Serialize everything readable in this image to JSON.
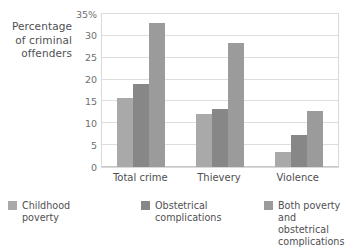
{
  "chart_data": {
    "type": "bar",
    "title": "",
    "subtitle": "",
    "xlabel": "",
    "ylabel": "Percentage of criminal offenders",
    "ylabel_lines": [
      "Percentage",
      "of criminal",
      "offenders"
    ],
    "categories": [
      "Total crime",
      "Thievery",
      "Violence"
    ],
    "series": [
      {
        "name": "Childhood poverty",
        "name_lines": [
          "Childhood",
          "poverty"
        ],
        "color": "#a9a9a9",
        "values": [
          15.7,
          12.1,
          3.5
        ]
      },
      {
        "name": "Obstetrical complications",
        "name_lines": [
          "Obstetrical",
          "complications"
        ],
        "color": "#878787",
        "values": [
          18.9,
          13.2,
          7.3
        ]
      },
      {
        "name": "Both poverty and obstetrical complications",
        "name_lines": [
          "Both poverty and",
          "obstetrical complications"
        ],
        "color": "#9b9b9b",
        "values": [
          32.9,
          28.3,
          12.7
        ]
      }
    ],
    "ylim": [
      0,
      35
    ],
    "ytick_values": [
      0,
      5,
      10,
      15,
      20,
      25,
      30,
      35
    ],
    "ytick_labels": [
      "0",
      "5",
      "10",
      "15",
      "20",
      "25",
      "30",
      "35%"
    ],
    "grid": true,
    "legend_position": "bottom",
    "plot_background": "#ffffff",
    "grid_color": "#dddddd",
    "axis_color": "#c8c8c8",
    "text_color": "#4f5052"
  }
}
